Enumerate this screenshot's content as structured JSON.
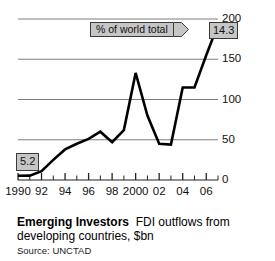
{
  "chart_data": {
    "type": "line",
    "title": "Emerging Investors",
    "subtitle": "FDI outflows from developing countries, $bn",
    "source": "Source: UNCTAD",
    "xlabel": "",
    "ylabel": "",
    "ylim": [
      0,
      200
    ],
    "yticks": [
      0,
      50,
      100,
      150,
      200
    ],
    "ytick_labels": [
      "0",
      "50",
      "100",
      "150",
      "200"
    ],
    "grid": true,
    "grid_axis": "y",
    "legend_position": "inside-top",
    "xlim": [
      1990,
      2007
    ],
    "x": [
      1990,
      1991,
      1992,
      1993,
      1994,
      1995,
      1996,
      1997,
      1998,
      1999,
      2000,
      2001,
      2002,
      2003,
      2004,
      2005,
      2006,
      2007
    ],
    "xtick_labels": [
      "1990",
      "92",
      "94",
      "96",
      "98",
      "2000",
      "02",
      "04",
      "06"
    ],
    "xtick_label_years": [
      1990,
      1992,
      1994,
      1996,
      1998,
      2000,
      2002,
      2004,
      2006
    ],
    "series": [
      {
        "name": "FDI outflows from developing countries, $bn",
        "color": "#000000",
        "values": [
          5.2,
          5.4,
          11,
          25,
          38,
          45,
          51,
          60,
          47,
          62,
          133,
          80,
          45,
          44,
          115,
          115,
          155,
          193
        ]
      }
    ],
    "annotations": [
      {
        "name": "start-value",
        "label": "5.2",
        "year": 1990,
        "value": 5.2
      },
      {
        "name": "end-value",
        "label": "14.3",
        "year": 2007,
        "value": 193
      }
    ],
    "legend_label": "% of world total"
  },
  "axes": {
    "y_labels": [
      "200",
      "150",
      "100",
      "50",
      "0"
    ],
    "x_labels": [
      "1990",
      "92",
      "94",
      "96",
      "98",
      "2000",
      "02",
      "04",
      "06"
    ]
  },
  "legend": {
    "label": "% of world total"
  },
  "callouts": {
    "start": "5.2",
    "end": "14.3"
  },
  "caption": {
    "title": "Emerging Investors",
    "subtitle": "FDI outflows from",
    "line2": "developing countries, $bn",
    "source": "Source: UNCTAD"
  },
  "colors": {
    "line": "#000000",
    "grid": "#6e6e6e",
    "callout_fill": "#c6c6c6",
    "callout_border": "#3a3a3a"
  }
}
